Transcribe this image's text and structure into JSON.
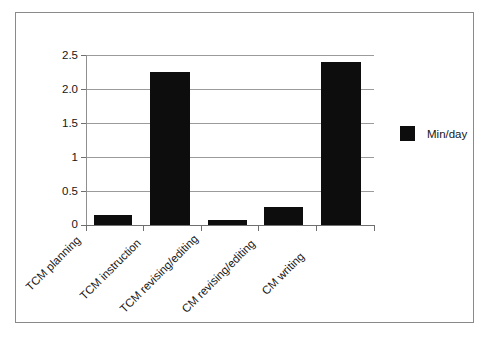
{
  "chart_data": {
    "type": "bar",
    "title": "",
    "subtitle": "",
    "xlabel": "",
    "ylabel": "",
    "categories": [
      "TCM planning",
      "TCM instruction",
      "TCM revising/editing",
      "CM revising/editing",
      "CM writing"
    ],
    "series": [
      {
        "name": "Min/day",
        "color": "#0d0d0d",
        "values": [
          0.15,
          2.25,
          0.08,
          0.27,
          2.4
        ]
      }
    ],
    "ylim": [
      0,
      2.5
    ],
    "ytick_labels": [
      "0",
      "0.5",
      "1",
      "1.5",
      "2.0",
      "2.5"
    ],
    "ytick_values": [
      0,
      0.5,
      1,
      1.5,
      2,
      2.5
    ],
    "grid": true,
    "legend_position": "right",
    "legend_entries": [
      "Min/day"
    ],
    "annotations": []
  },
  "legend": {
    "label": "Min/day",
    "swatch_name": "series-color-swatch"
  },
  "colors": {
    "bar_fill": "#0d0d0d",
    "gridline": "#9b9b9b",
    "axis": "#6f6f6f",
    "frame_border": "#8a8a8a",
    "background": "#ffffff",
    "text": "#161616"
  }
}
